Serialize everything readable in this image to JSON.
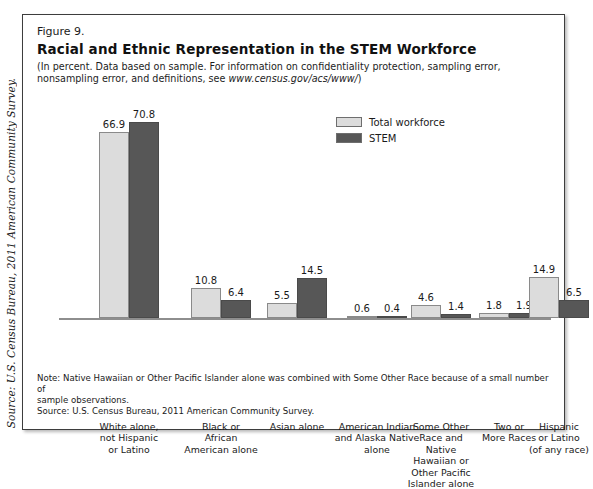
{
  "side_source": "Source: U.S. Census Bureau, 2011 American Community Survey.",
  "figure": {
    "number": "Figure 9.",
    "title": "Racial and Ethnic Representation in the STEM Workforce",
    "subtitle_line1": "(In percent. Data based on sample. For information on confidentiality protection, sampling error, nonsampling error,",
    "subtitle_line2_pre": "and definitions, see ",
    "subtitle_url": "www.census.gov/acs/www/",
    "subtitle_line2_post": ")"
  },
  "legend": {
    "items": [
      {
        "label": "Total workforce",
        "color": "#dcdcdc"
      },
      {
        "label": "STEM",
        "color": "#575757"
      }
    ]
  },
  "notes": {
    "note": "Note: Native Hawaiian or Other Pacific Islander alone was combined with Some Other Race because of a small number of",
    "note_cont": "sample observations.",
    "source": "Source: U.S. Census Bureau, 2011 American Community Survey."
  },
  "chart_data": {
    "type": "bar",
    "title": "Racial and Ethnic Representation in the STEM Workforce",
    "xlabel": "",
    "ylabel": "Percent",
    "ylim": [
      0,
      75
    ],
    "grid": false,
    "legend_position": "top-right",
    "categories": [
      "White alone, not Hispanic or Latino",
      "Black or African American alone",
      "Asian alone",
      "American Indian and Alaska Native alone",
      "Some Other Race and Native Hawaiian or Other Pacific Islander alone",
      "Two or More Races",
      "Hispanic or Latino (of any race)"
    ],
    "category_lines": [
      [
        "White alone,",
        "not Hispanic",
        "or Latino"
      ],
      [
        "Black or",
        "African",
        "American alone"
      ],
      [
        "Asian alone"
      ],
      [
        "American Indian",
        "and Alaska Native",
        "alone"
      ],
      [
        "Some Other",
        "Race and",
        "Native",
        "Hawaiian or",
        "Other Pacific",
        "Islander alone"
      ],
      [
        "Two or",
        "More Races"
      ],
      [
        "Hispanic",
        "or Latino",
        "(of any race)"
      ]
    ],
    "series": [
      {
        "name": "Total workforce",
        "color": "#dcdcdc",
        "values": [
          66.9,
          10.8,
          5.5,
          0.6,
          4.6,
          1.8,
          14.9
        ]
      },
      {
        "name": "STEM",
        "color": "#575757",
        "values": [
          70.8,
          6.4,
          14.5,
          0.4,
          1.4,
          1.9,
          6.5
        ]
      }
    ]
  }
}
